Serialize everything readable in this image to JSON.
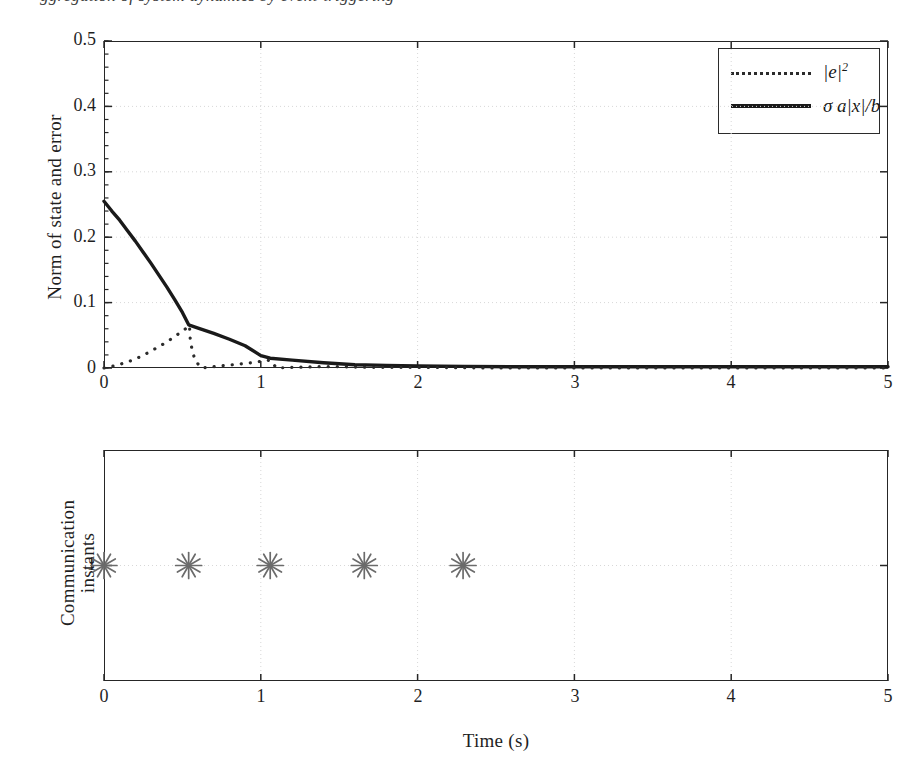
{
  "figure": {
    "cut_caption_sliver": "ggregation of system dynamics by event-triggering"
  },
  "panels": {
    "top": {
      "ylabel": "Norm of state and error",
      "yticks": [
        "0",
        "0.1",
        "0.2",
        "0.3",
        "0.4",
        "0.5"
      ],
      "ytick_values": [
        0,
        0.1,
        0.2,
        0.3,
        0.4,
        0.5
      ],
      "xticks": [
        "0",
        "1",
        "2",
        "3",
        "4",
        "5"
      ],
      "xtick_values": [
        0,
        1,
        2,
        3,
        4,
        5
      ],
      "legend": {
        "position": "upper-right",
        "entries": [
          {
            "label": "|e|",
            "superscript": "2",
            "style": "dotted",
            "name": "error-norm-squared"
          },
          {
            "label": "σ a|x|/b",
            "superscript": "",
            "style": "solid",
            "name": "sigma-a-x-over-b"
          }
        ]
      }
    },
    "bottom": {
      "ylabel": "Communication\ninstants",
      "yticks": [
        "1"
      ],
      "ytick_values": [
        1
      ],
      "xticks": [
        "0",
        "1",
        "2",
        "3",
        "4",
        "5"
      ],
      "xtick_values": [
        0,
        1,
        2,
        3,
        4,
        5
      ],
      "xlabel": "Time (s)"
    }
  },
  "colors": {
    "axis": "#262626",
    "curve_solid": "#1a1a1a",
    "curve_dotted": "#2b2b2b",
    "grid": "#d8d8d8",
    "marker": "#6b6b6b",
    "text": "#1f1f1f",
    "background": "#ffffff"
  },
  "chart_data": [
    {
      "type": "line",
      "name": "norm-of-state-and-error",
      "title": "",
      "xlabel": "",
      "ylabel": "Norm of state and error",
      "xlim": [
        0,
        5
      ],
      "ylim": [
        0,
        0.5
      ],
      "grid": true,
      "legend_position": "upper right",
      "series": [
        {
          "name": "σ a|x|/b",
          "style": "solid",
          "x": [
            0.0,
            0.05,
            0.1,
            0.15,
            0.2,
            0.25,
            0.3,
            0.35,
            0.4,
            0.45,
            0.5,
            0.54,
            0.6,
            0.7,
            0.8,
            0.9,
            1.0,
            1.06,
            1.2,
            1.4,
            1.6,
            1.8,
            2.0,
            2.3,
            2.6,
            3.0,
            3.5,
            4.0,
            4.5,
            5.0
          ],
          "y": [
            0.255,
            0.24,
            0.226,
            0.21,
            0.194,
            0.177,
            0.16,
            0.142,
            0.124,
            0.105,
            0.085,
            0.066,
            0.061,
            0.053,
            0.044,
            0.034,
            0.019,
            0.015,
            0.012,
            0.008,
            0.005,
            0.004,
            0.003,
            0.0025,
            0.002,
            0.002,
            0.002,
            0.002,
            0.002,
            0.002
          ]
        },
        {
          "name": "|e|²",
          "style": "dotted",
          "x": [
            0.0,
            0.08,
            0.16,
            0.24,
            0.3,
            0.36,
            0.42,
            0.48,
            0.52,
            0.545,
            0.55,
            0.56,
            0.58,
            0.62,
            0.7,
            0.78,
            0.86,
            0.94,
            1.02,
            1.06,
            1.1,
            1.2,
            1.35,
            1.5,
            1.7,
            2.0,
            2.5,
            3.0,
            4.0,
            5.0
          ],
          "y": [
            0.0,
            0.004,
            0.01,
            0.018,
            0.026,
            0.034,
            0.043,
            0.053,
            0.06,
            0.065,
            0.044,
            0.03,
            0.012,
            0.0,
            0.002,
            0.004,
            0.006,
            0.008,
            0.011,
            0.012,
            0.0,
            0.001,
            0.002,
            0.002,
            0.001,
            0.001,
            0.0,
            0.0,
            0.0,
            0.0
          ]
        }
      ]
    },
    {
      "type": "scatter",
      "name": "communication-instants",
      "title": "",
      "xlabel": "Time (s)",
      "ylabel": "Communication instants",
      "xlim": [
        0,
        5
      ],
      "ylim": [
        0,
        2
      ],
      "grid": true,
      "marker": "asterisk",
      "series": [
        {
          "name": "communication events",
          "x": [
            0.0,
            0.54,
            1.06,
            1.66,
            2.29
          ],
          "y": [
            1,
            1,
            1,
            1,
            1
          ]
        }
      ]
    }
  ]
}
